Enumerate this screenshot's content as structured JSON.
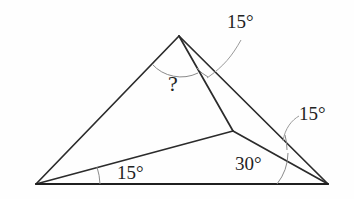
{
  "figure": {
    "kind": "geometry-diagram",
    "background_color": "#fefefe",
    "line_color": "#2b2b2b",
    "arc_color": "#8a8a8a",
    "text_color": "#232323"
  },
  "vertices": {
    "apex": {
      "name": "apex",
      "x": 179,
      "y": 36
    },
    "bottom_left": {
      "name": "bottom-left-vertex",
      "x": 36,
      "y": 184
    },
    "bottom_right": {
      "name": "bottom-right-vertex",
      "x": 328,
      "y": 184
    },
    "interior": {
      "name": "interior-point",
      "x": 233,
      "y": 131
    }
  },
  "segments": [
    {
      "name": "apex-to-bottom-left",
      "from": "apex",
      "to": "bottom_left"
    },
    {
      "name": "apex-to-bottom-right",
      "from": "apex",
      "to": "bottom_right"
    },
    {
      "name": "apex-to-interior",
      "from": "apex",
      "to": "interior"
    },
    {
      "name": "bottom-left-to-interior",
      "from": "bottom_left",
      "to": "interior"
    },
    {
      "name": "interior-to-bottom-right",
      "from": "interior",
      "to": "bottom_right"
    },
    {
      "name": "base",
      "from": "bottom_left",
      "to": "bottom_right"
    }
  ],
  "labels": {
    "unknown_angle": {
      "text": "?",
      "at_vertex": "apex",
      "x": 168,
      "y": 73
    },
    "angle_apex_right": {
      "text": "15°",
      "at_vertex": "apex",
      "x": 227,
      "y": 12
    },
    "angle_right_upper": {
      "text": "15°",
      "at_vertex": "bottom_right",
      "x": 299,
      "y": 104
    },
    "angle_base_left": {
      "text": "15°",
      "at_vertex": "bottom_left",
      "x": 117,
      "y": 163
    },
    "angle_base_right": {
      "text": "30°",
      "at_vertex": "bottom_right",
      "x": 235,
      "y": 154
    }
  },
  "angle_values": {
    "unknown": "?",
    "apex_right": "15°",
    "right_upper": "15°",
    "base_left": "15°",
    "base_right": "30°"
  }
}
